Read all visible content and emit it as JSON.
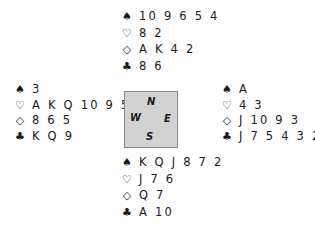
{
  "suit_symbols": {
    "spades": "♠",
    "hearts": "♡",
    "diamonds": "◇",
    "clubs": "♣"
  },
  "compass": {
    "north": "N",
    "west": "W",
    "east": "E",
    "south": "S"
  },
  "hands": {
    "north": {
      "spades": "10 9 6 5 4",
      "hearts": "8 2",
      "diamonds": "A K 4 2",
      "clubs": "8 6"
    },
    "west": {
      "spades": "3",
      "hearts": "A K Q 10 9 5",
      "diamonds": "8 6 5",
      "clubs": "K Q 9"
    },
    "east": {
      "spades": "A",
      "hearts": "4 3",
      "diamonds": "J 10 9 3",
      "clubs": "J 7 5 4 3 2"
    },
    "south": {
      "spades": "K Q J 8 7 2",
      "hearts": "J 7 6",
      "diamonds": "Q 7",
      "clubs": "A 10"
    }
  }
}
